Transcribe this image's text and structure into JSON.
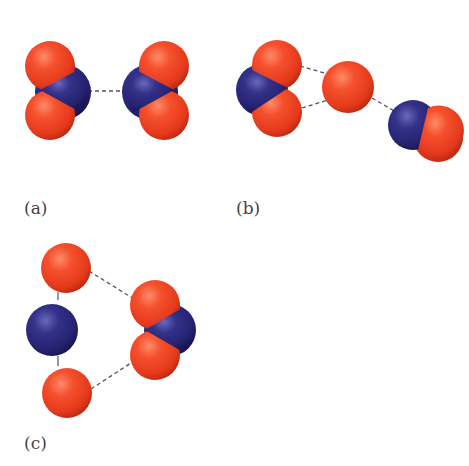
{
  "diagram": {
    "panels": [
      {
        "id": "a",
        "label": "(a)",
        "description": "Two NO2 molecules with N atoms facing each other, joined by a dashed line"
      },
      {
        "id": "b",
        "label": "(b)",
        "description": "NO2 molecule, a single O atom, and an NO molecule linked by dashed lines"
      },
      {
        "id": "c",
        "label": "(c)",
        "description": "O-N-O chain linked by dashed lines to an NO2 molecule"
      }
    ],
    "atoms": {
      "oxygen": {
        "element": "O",
        "color": "#f04a2a"
      },
      "nitrogen": {
        "element": "N",
        "color": "#2c2a7a"
      }
    },
    "bond_style": "dashed"
  }
}
